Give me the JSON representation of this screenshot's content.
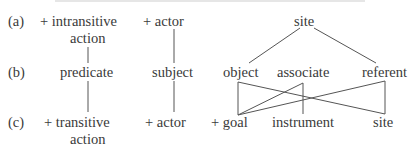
{
  "rows": {
    "a": {
      "label": "(a)",
      "items": [
        {
          "text": "+ intransitive",
          "text2": "action"
        },
        {
          "text": "+ actor"
        },
        {
          "text": "site"
        }
      ]
    },
    "b": {
      "label": "(b)",
      "items": [
        {
          "text": "predicate"
        },
        {
          "text": "subject"
        },
        {
          "text": "object"
        },
        {
          "text": "associate"
        },
        {
          "text": "referent"
        }
      ]
    },
    "c": {
      "label": "(c)",
      "items": [
        {
          "text": "+ transitive",
          "text2": "action"
        },
        {
          "text": "+ actor"
        },
        {
          "text": "+ goal"
        },
        {
          "text": "instrument"
        },
        {
          "text": "site"
        }
      ]
    }
  },
  "connections": [
    {
      "from": "a.intransitive-action",
      "to": "b.predicate"
    },
    {
      "from": "a.actor",
      "to": "b.subject"
    },
    {
      "from": "a.site",
      "to": "b.object"
    },
    {
      "from": "a.site",
      "to": "b.referent"
    },
    {
      "from": "b.predicate",
      "to": "c.transitive-action"
    },
    {
      "from": "b.subject",
      "to": "c.actor"
    },
    {
      "from": "b.object",
      "to": "c.goal"
    },
    {
      "from": "b.object",
      "to": "c.site"
    },
    {
      "from": "b.associate",
      "to": "c.goal"
    },
    {
      "from": "b.associate",
      "to": "c.instrument"
    },
    {
      "from": "b.referent",
      "to": "c.goal"
    },
    {
      "from": "b.referent",
      "to": "c.site"
    }
  ]
}
